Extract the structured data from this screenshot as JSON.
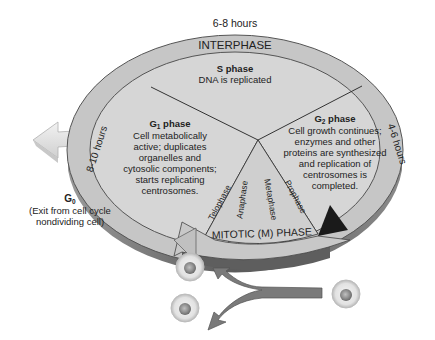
{
  "diagram": {
    "title_duration_top": "6-8 hours",
    "interphase_label": "INTERPHASE",
    "mitotic_label": "MITOTIC (M) PHASE",
    "s_phase": {
      "title": "S phase",
      "lines": [
        "DNA is replicated"
      ]
    },
    "g1_phase": {
      "title_main": "G",
      "title_sub": "1",
      "title_rest": " phase",
      "lines": [
        "Cell metabolically",
        "active; duplicates",
        "organelles and",
        "cytosolic components;",
        "starts replicating",
        "centrosomes."
      ],
      "duration": "8-10 hours"
    },
    "g2_phase": {
      "title_main": "G",
      "title_sub": "2",
      "title_rest": " phase",
      "lines": [
        "Cell growth continues;",
        "enzymes and other",
        "proteins are synthesized",
        "and replication of",
        "centrosomes is",
        "completed."
      ],
      "duration": "4-6 hours"
    },
    "g0": {
      "title_main": "G",
      "title_sub": "0",
      "lines": [
        "(Exit from cell cycle",
        "nondividing cell)"
      ]
    },
    "mitosis_stages": [
      "Telophase",
      "Anaphase",
      "Metaphase",
      "Prophase"
    ],
    "colors": {
      "disk_top": "#d4d4d4",
      "disk_ring": "#c4c4c4",
      "disk_edge": "#7a7a7a",
      "arrow_gray": "#777777",
      "cell": "#d8d8d8"
    }
  }
}
